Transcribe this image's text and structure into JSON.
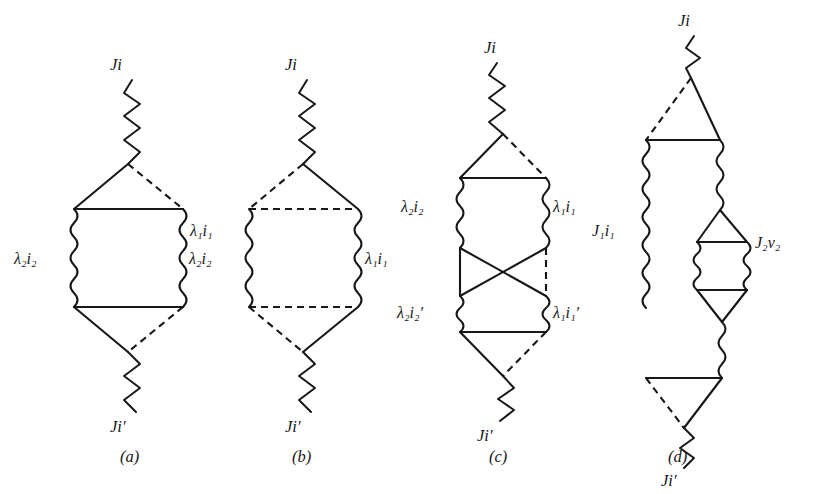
{
  "figure": {
    "background_color": "#ffffff",
    "ink_color": "#17171a",
    "kind": "angular-momentum-coupling-diagrams",
    "panel_count": 4
  },
  "panels": [
    {
      "id": "a",
      "caption": "(a)",
      "caption_x": 120,
      "caption_y": 462,
      "labels": {
        "top": "Ji",
        "bottom": "Ji′",
        "left": "λ₂i₂",
        "right": "λ₁i₁"
      }
    },
    {
      "id": "b",
      "caption": "(b)",
      "caption_x": 292,
      "caption_y": 462,
      "labels": {
        "top": "Ji",
        "bottom": "Ji′",
        "left": "λ₂i₂",
        "right": "λ₁i₁"
      }
    },
    {
      "id": "c",
      "caption": "(c)",
      "caption_x": 489,
      "caption_y": 462,
      "labels": {
        "top": "Ji",
        "bottom": "Ji′",
        "left_upper": "λ₂i₂",
        "right_upper": "λ₁i₁",
        "left_lower": "λ₂i₂′",
        "right_lower": "λ₁i₁′"
      }
    },
    {
      "id": "d",
      "caption": "(d)",
      "caption_x": 668,
      "caption_y": 462,
      "labels": {
        "top": "Ji",
        "bottom": "Ji′",
        "left": "J₁i₁",
        "right": "J₂ν₂"
      }
    }
  ],
  "label_text": {
    "Ji": {
      "base": "J",
      "rest": "i"
    },
    "Ji_prime": {
      "base": "J",
      "rest": "i′"
    },
    "lambda2_i2": {
      "greek": "λ",
      "sub1": "2",
      "mid": "i",
      "sub2": "2"
    },
    "lambda1_i1": {
      "greek": "λ",
      "sub1": "1",
      "mid": "i",
      "sub2": "1"
    },
    "lambda2_i2p": {
      "greek": "λ",
      "sub1": "2",
      "mid": "i",
      "sub2": "2",
      "prime": "′"
    },
    "lambda1_i1p": {
      "greek": "λ",
      "sub1": "1",
      "mid": "i",
      "sub2": "1",
      "prime": "′"
    },
    "J1_i1": {
      "base": "J",
      "sub1": "1",
      "mid": "i",
      "sub2": "1"
    },
    "J2_nu2": {
      "base": "J",
      "sub1": "2",
      "mid": "ν",
      "sub2": "2"
    }
  },
  "legend_semantics": {
    "solid_line": "particle / solid propagator line",
    "dashed_line": "hole / dashed propagator line",
    "zigzag_line": "external interaction vertex (sharp zigzag)",
    "squiggle_line": "internal boson / phonon line (squiggle)"
  }
}
